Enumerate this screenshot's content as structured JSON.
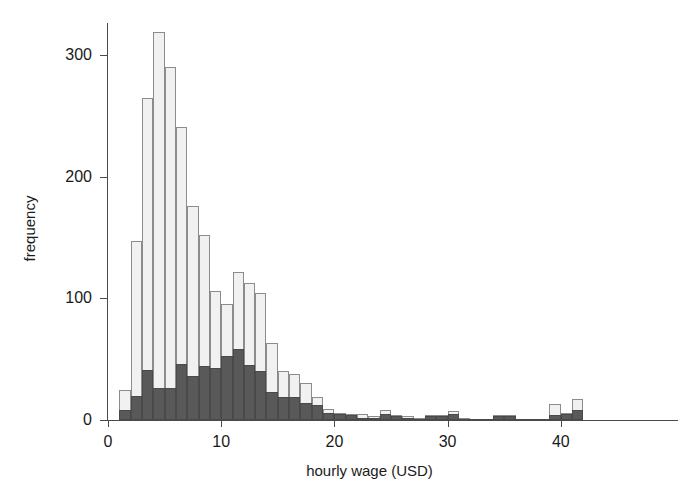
{
  "chart_data": {
    "type": "bar",
    "chart_subtype": "stacked-histogram",
    "title": "",
    "xlabel": "hourly wage (USD)",
    "ylabel": "frequency",
    "xlim": [
      0,
      42
    ],
    "ylim": [
      0,
      330
    ],
    "x_ticks": [
      0,
      10,
      20,
      30,
      40
    ],
    "x_tick_labels": [
      "0",
      "10",
      "20",
      "30",
      "40"
    ],
    "y_ticks": [
      0,
      100,
      200,
      300
    ],
    "y_tick_labels": [
      "0",
      "100",
      "200",
      "300"
    ],
    "grid": false,
    "legend": "none",
    "bin_width": 1,
    "bin_starts": [
      1,
      2,
      3,
      4,
      5,
      6,
      7,
      8,
      9,
      10,
      11,
      12,
      13,
      14,
      15,
      16,
      17,
      18,
      19,
      20,
      21,
      22,
      23,
      24,
      25,
      26,
      27,
      28,
      29,
      30,
      31,
      32,
      33,
      34,
      35,
      36,
      37,
      38,
      39,
      40,
      41
    ],
    "series": [
      {
        "name": "total",
        "color": "#f1f1f1",
        "values": [
          25,
          147,
          265,
          319,
          290,
          241,
          176,
          152,
          106,
          95,
          122,
          113,
          104,
          63,
          40,
          38,
          30,
          19,
          9,
          6,
          5,
          5,
          3,
          8,
          4,
          3,
          2,
          4,
          4,
          7,
          2,
          1,
          1,
          4,
          4,
          1,
          1,
          1,
          13,
          6,
          17
        ]
      },
      {
        "name": "subgroup",
        "color": "#595959",
        "values": [
          8,
          20,
          41,
          26,
          26,
          46,
          36,
          44,
          43,
          53,
          58,
          45,
          40,
          23,
          19,
          19,
          14,
          12,
          6,
          5,
          4,
          2,
          2,
          5,
          3,
          2,
          1,
          3,
          3,
          5,
          1,
          1,
          1,
          3,
          3,
          1,
          1,
          1,
          4,
          5,
          8
        ]
      }
    ]
  },
  "axes": {
    "x_title": "hourly wage (USD)",
    "y_title": "frequency"
  },
  "style": {
    "background": "#ffffff",
    "axis_color": "#4a4a4a",
    "total_fill": "#f1f1f1",
    "total_stroke": "#8c8c8c",
    "sub_fill": "#595959",
    "sub_stroke": "#4a4a4a",
    "text_color": "#1a1a1a"
  }
}
